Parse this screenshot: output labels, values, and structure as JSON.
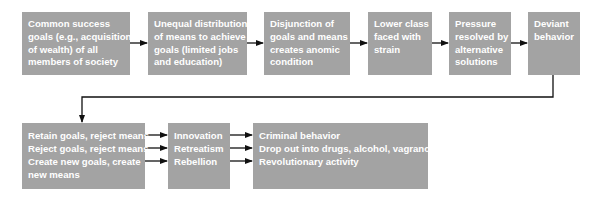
{
  "diagram": {
    "type": "flowchart",
    "colors": {
      "box_fill": "#a3a3a3",
      "box_text": "#ffffff",
      "arrow": "#111111",
      "background": "#ffffff"
    },
    "row1": [
      {
        "id": "common-goals",
        "lines": [
          "Common success",
          "goals (e.g., acquisition",
          "of wealth) of all",
          "members of society"
        ]
      },
      {
        "id": "unequal-distribution",
        "lines": [
          "Unequal distribution",
          "of means to achieve",
          "goals (limited jobs",
          "and education)"
        ]
      },
      {
        "id": "disjunction",
        "lines": [
          "Disjunction of",
          "goals and means",
          "creates anomic",
          "condition"
        ]
      },
      {
        "id": "lower-class-strain",
        "lines": [
          "Lower class",
          "faced with",
          "strain"
        ]
      },
      {
        "id": "pressure-resolved",
        "lines": [
          "Pressure",
          "resolved by",
          "alternative",
          "solutions"
        ]
      },
      {
        "id": "deviant-behavior",
        "lines": [
          "Deviant",
          "behavior"
        ]
      }
    ],
    "row2": [
      {
        "id": "responses",
        "lines": [
          "Retain goals, reject means",
          "Reject goals, reject means",
          "Create new goals, create",
          "new means"
        ]
      },
      {
        "id": "adaptations",
        "lines": [
          "Innovation",
          "Retreatism",
          "Rebellion"
        ]
      },
      {
        "id": "outcomes",
        "lines": [
          "Criminal behavior",
          "Drop out into drugs, alcohol, vagrancy",
          "Revolutionary activity"
        ]
      }
    ]
  }
}
